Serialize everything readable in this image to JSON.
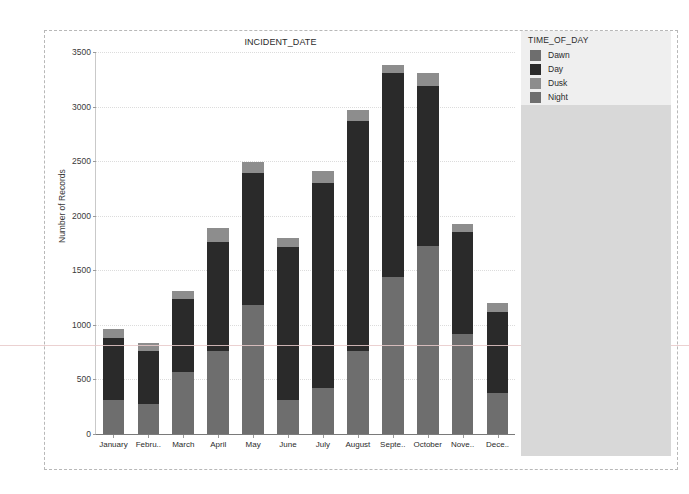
{
  "chart_data": {
    "type": "bar",
    "stacked": true,
    "title": "INCIDENT_DATE",
    "xlabel": "",
    "ylabel": "Number of Records",
    "ylim": [
      0,
      3500
    ],
    "yticks": [
      0,
      500,
      1000,
      1500,
      2000,
      2500,
      3000,
      3500
    ],
    "ytick_labels": [
      "0",
      "500",
      "1000",
      "1500",
      "2000",
      "2500",
      "3000",
      "3500"
    ],
    "grid": true,
    "legend_position": "right",
    "legend_title": "TIME_OF_DAY",
    "categories": [
      "January",
      "Febru..",
      "March",
      "April",
      "May",
      "June",
      "July",
      "August",
      "Septe..",
      "October",
      "Nove..",
      "Dece.."
    ],
    "category_full": [
      "January",
      "February",
      "March",
      "April",
      "May",
      "June",
      "July",
      "August",
      "September",
      "October",
      "November",
      "December"
    ],
    "series": [
      {
        "name": "Dawn",
        "color": "#6e6e6e",
        "values": [
          310,
          275,
          565,
          760,
          1180,
          310,
          425,
          760,
          1440,
          1720,
          920,
          375
        ]
      },
      {
        "name": "Day",
        "color": "#2a2a2a",
        "values": [
          570,
          485,
          670,
          1000,
          1210,
          1405,
          1875,
          2105,
          1870,
          1470,
          930,
          740
        ]
      },
      {
        "name": "Dusk",
        "color": "#8d8d8d",
        "values": [
          80,
          70,
          75,
          125,
          105,
          80,
          110,
          105,
          75,
          120,
          70,
          85
        ]
      },
      {
        "name": "Night",
        "color": "#6e6e6e",
        "values": [
          0,
          0,
          0,
          0,
          0,
          0,
          0,
          0,
          0,
          0,
          0,
          0
        ]
      }
    ],
    "totals": [
      960,
      830,
      1310,
      1885,
      2495,
      1795,
      2410,
      2970,
      3385,
      3310,
      1920,
      1200
    ]
  },
  "legend": {
    "title": "TIME_OF_DAY",
    "items": [
      {
        "label": "Dawn",
        "color": "#6e6e6e"
      },
      {
        "label": "Day",
        "color": "#2a2a2a"
      },
      {
        "label": "Dusk",
        "color": "#8d8d8d"
      },
      {
        "label": "Night",
        "color": "#6e6e6e"
      }
    ]
  },
  "colors": {
    "panel_background": "#d8d8d8",
    "legend_card_background": "#efefef",
    "plot_background": "#ffffff",
    "axis": "#7a7a7a",
    "gridline": "#dcdcdc",
    "text": "#2b2b2b"
  }
}
